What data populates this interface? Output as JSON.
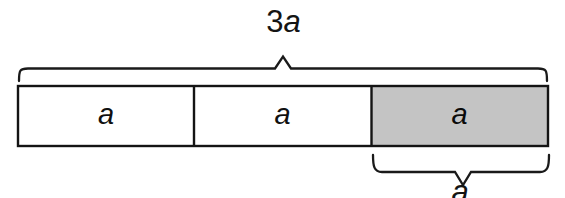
{
  "figure": {
    "type": "bar-model-diagram",
    "background_color": "#ffffff",
    "line_color": "#141414",
    "shaded_fill_color": "#c4c4c4"
  },
  "top_brace": {
    "label_number": "3",
    "label_variable": "a",
    "spans_segments": 3,
    "x_start": 18,
    "x_end": 548,
    "peak_x": 283
  },
  "bar": {
    "x_start": 18,
    "x_end": 548,
    "y_top": 86,
    "y_bottom": 146,
    "dividers_x": [
      194,
      371
    ],
    "segments": [
      {
        "label": "a",
        "fill": "#ffffff",
        "shaded": false
      },
      {
        "label": "a",
        "fill": "#ffffff",
        "shaded": false
      },
      {
        "label": "a",
        "fill": "#c4c4c4",
        "shaded": true
      }
    ]
  },
  "bottom_brace": {
    "label": "a",
    "spans_segments": 1,
    "x_start": 372,
    "x_end": 549,
    "point_x": 463
  }
}
